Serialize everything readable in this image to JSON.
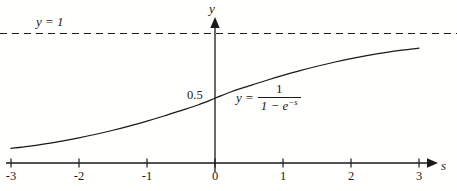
{
  "figure": {
    "kind": "function-plot",
    "background_color": "#fffffe",
    "ink_color": "#1a1a1a"
  },
  "labels": {
    "asymptote": "y = 1",
    "y_axis": "y",
    "x_axis": "s",
    "half_value": "0.5",
    "curve_eq_lhs": "y =",
    "curve_eq_numerator": "1",
    "curve_eq_denominator_a": "1 − e",
    "curve_eq_denominator_exponent": "−s"
  },
  "chart_data": {
    "type": "line",
    "title": "",
    "xlabel": "s",
    "ylabel": "y",
    "xlim": [
      -3,
      3
    ],
    "ylim": [
      0,
      1.06
    ],
    "grid": false,
    "legend": "none",
    "xticks": [
      -3,
      -2,
      -1,
      0,
      1,
      2,
      3
    ],
    "xtick_labels": [
      "-3",
      "-2",
      "-1",
      "0",
      "1",
      "2",
      "3"
    ],
    "yticks": [
      0.5,
      1
    ],
    "ytick_labels": [
      "0.5",
      "y = 1"
    ],
    "annotations": [
      {
        "text": "y = 1",
        "x": -2.65,
        "y": 1.05,
        "role": "asymptote-label"
      },
      {
        "text": "0.5",
        "x": -0.42,
        "y": 0.52,
        "role": "y-intercept-label"
      },
      {
        "text": "y = 1/(1 - e^-s)",
        "x": 0.32,
        "y": 0.63,
        "role": "curve-equation"
      }
    ],
    "series": [
      {
        "name": "logistic",
        "equation": "y = 1/(1 - e^{-s})",
        "style": "solid",
        "x": [
          -3,
          -2.75,
          -2.5,
          -2.25,
          -2,
          -1.75,
          -1.5,
          -1.25,
          -1,
          -0.75,
          -0.5,
          -0.25,
          0,
          0.25,
          0.5,
          0.75,
          1,
          1.25,
          1.5,
          1.75,
          2,
          2.25,
          2.5,
          2.75,
          3
        ],
        "values": [
          0.113,
          0.129,
          0.148,
          0.169,
          0.194,
          0.222,
          0.253,
          0.287,
          0.324,
          0.363,
          0.405,
          0.448,
          0.5,
          0.552,
          0.595,
          0.637,
          0.676,
          0.713,
          0.747,
          0.778,
          0.806,
          0.831,
          0.852,
          0.871,
          0.887
        ]
      },
      {
        "name": "asymptote",
        "equation": "y = 1",
        "style": "dashed",
        "x": [
          -3.2,
          3.2
        ],
        "values": [
          1,
          1
        ]
      }
    ]
  }
}
